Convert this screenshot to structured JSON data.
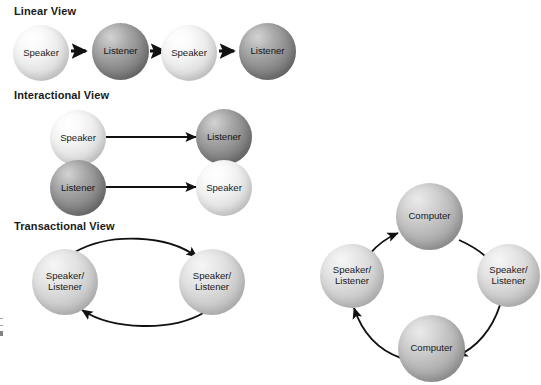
{
  "figure": {
    "title_visible": false,
    "background": "#ffffff",
    "text_color": "#1a1a1a"
  },
  "sections": [
    {
      "key": "linear",
      "heading": "Linear View"
    },
    {
      "key": "interactional",
      "heading": "Interactional View"
    },
    {
      "key": "transactional",
      "heading": "Transactional View"
    }
  ],
  "linear_view": {
    "heading": "Linear View",
    "nodes": [
      {
        "label": "Speaker",
        "shade": "light"
      },
      {
        "label": "Listener",
        "shade": "dark"
      },
      {
        "label": "Speaker",
        "shade": "light"
      },
      {
        "label": "Listener",
        "shade": "dark"
      }
    ],
    "arrows": [
      {
        "from": "Speaker",
        "to": "Listener",
        "style": "straight-short"
      },
      {
        "from": "Listener",
        "to": "Speaker",
        "style": "straight-short"
      },
      {
        "from": "Speaker",
        "to": "Listener",
        "style": "straight-short"
      }
    ]
  },
  "interactional_view": {
    "heading": "Interactional View",
    "rows": [
      {
        "left": {
          "label": "Speaker",
          "shade": "light"
        },
        "right": {
          "label": "Listener",
          "shade": "dark"
        },
        "arrow": {
          "direction": "left-to-right",
          "style": "straight-long"
        }
      },
      {
        "left": {
          "label": "Listener",
          "shade": "dark"
        },
        "right": {
          "label": "Speaker",
          "shade": "light"
        },
        "arrow": {
          "direction": "left-to-right",
          "style": "straight-long"
        }
      }
    ]
  },
  "transactional_view": {
    "heading": "Transactional View",
    "nodes": [
      {
        "label": "Speaker/\nListener",
        "shade": "medlight"
      },
      {
        "label": "Speaker/\nListener",
        "shade": "medlight"
      }
    ],
    "arrows": [
      {
        "direction": "left-to-right",
        "style": "curve-over"
      },
      {
        "direction": "right-to-left",
        "style": "curve-under"
      }
    ]
  },
  "mediated_cycle": {
    "heading": "",
    "nodes": [
      {
        "position": "top",
        "label": "Computer",
        "shade": "med"
      },
      {
        "position": "right",
        "label": "Speaker/\nListener",
        "shade": "medlight"
      },
      {
        "position": "bottom",
        "label": "Computer",
        "shade": "med"
      },
      {
        "position": "left",
        "label": "Speaker/\nListener",
        "shade": "medlight"
      }
    ],
    "arrows": [
      {
        "from": "top",
        "to": "right",
        "style": "arc-clockwise"
      },
      {
        "from": "right",
        "to": "bottom",
        "style": "arc-clockwise"
      },
      {
        "from": "bottom",
        "to": "left",
        "style": "arc-clockwise"
      },
      {
        "from": "left",
        "to": "top",
        "style": "arc-clockwise"
      }
    ]
  },
  "colors": {
    "arrow": "#111111",
    "sphere_light_base": "#e6e6e6",
    "sphere_dark_base": "#8a8a8a",
    "sphere_medium_base": "#b5b5b5",
    "heading_text": "#1a1a1a"
  }
}
